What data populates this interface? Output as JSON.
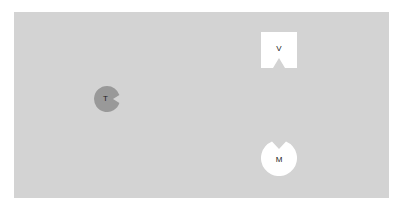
{
  "board": {
    "background": "#d3d3d3"
  },
  "pieces": [
    {
      "id": "V",
      "label": "V",
      "shape": "square-notched-bottom",
      "color": "#ffffff"
    },
    {
      "id": "T",
      "label": "T",
      "shape": "circle-notched-right",
      "color": "#999999"
    },
    {
      "id": "M",
      "label": "M",
      "shape": "circle-notched-top",
      "color": "#ffffff"
    }
  ]
}
